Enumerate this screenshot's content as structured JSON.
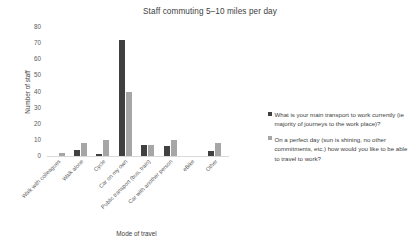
{
  "chart_data": {
    "type": "bar",
    "title": "Staff commuting 5–10 miles per day",
    "xlabel": "Mode of travel",
    "ylabel": "Number of staff",
    "ylim": [
      0,
      80
    ],
    "ytick_step": 10,
    "yticks": [
      "0",
      "10",
      "20",
      "30",
      "40",
      "50",
      "60",
      "70",
      "80"
    ],
    "grid": false,
    "legend_position": "right",
    "categories": [
      "Walk with colleagues",
      "Walk alone",
      "Cycle",
      "Car on my own",
      "Public transport (bus, train)",
      "Car with another person",
      "eBike",
      "Other"
    ],
    "series": [
      {
        "name": "What is your main transport to work currently (ie majority of journeys to the work place)?",
        "color": "#404040",
        "values": [
          0,
          4,
          1,
          72,
          7,
          6,
          0,
          3
        ]
      },
      {
        "name": "On a perfect day (sun is shining, no other commitments, etc.) how would you like to be able to travel to work?",
        "color": "#a6a6a6",
        "values": [
          2,
          8,
          10,
          40,
          7,
          10,
          0,
          8
        ]
      }
    ]
  },
  "legend": {
    "items": [
      {
        "marker": "square-marker",
        "label": "What is your main transport to work currently (ie majority of journeys to the work place)?"
      },
      {
        "marker": "square-marker",
        "label": "On a perfect day (sun is shining, no other commitments, etc.) how would you like to be able to travel to work?"
      }
    ]
  }
}
